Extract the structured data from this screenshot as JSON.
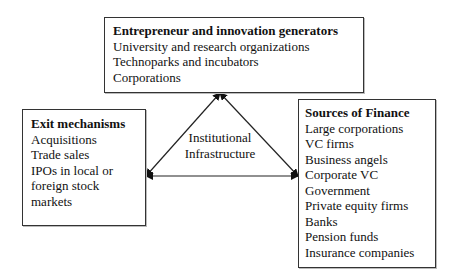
{
  "nodes": {
    "top": {
      "title": "Entrepreneur and innovation generators",
      "items": [
        "University and research organizations",
        "Technoparks and incubators",
        "Corporations"
      ]
    },
    "left": {
      "title": "Exit mechanisms",
      "items": [
        "Acquisitions",
        "Trade sales",
        "IPOs in local or",
        "foreign stock",
        "markets"
      ]
    },
    "right": {
      "title": "Sources of Finance",
      "items": [
        "Large corporations",
        "VC firms",
        "Business angels",
        "Corporate VC",
        "Government",
        "Private equity firms",
        "Banks",
        "Pension funds",
        "Insurance companies"
      ]
    }
  },
  "center": {
    "line1": "Institutional",
    "line2": "Infrastructure"
  },
  "edges": [
    {
      "from": "left",
      "to": "top",
      "bidirectional": true
    },
    {
      "from": "top",
      "to": "right",
      "bidirectional": true
    },
    {
      "from": "left",
      "to": "right",
      "bidirectional": true
    }
  ]
}
